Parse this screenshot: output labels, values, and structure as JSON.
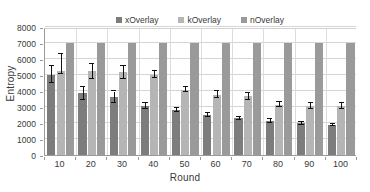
{
  "chart_data": {
    "type": "bar",
    "title": "",
    "xlabel": "Round",
    "ylabel": "Entropy",
    "categories": [
      "10",
      "20",
      "30",
      "40",
      "50",
      "60",
      "70",
      "80",
      "90",
      "100"
    ],
    "ylim": [
      0,
      8000
    ],
    "ytick_step": 1000,
    "yticks": [
      "0",
      "1000",
      "2000",
      "3000",
      "4000",
      "5000",
      "6000",
      "7000",
      "8000"
    ],
    "grid": true,
    "grid_axis": "both",
    "legend_position": "top-center",
    "series": [
      {
        "name": "xOverlay",
        "color": "#7d7d7d",
        "values": [
          5030,
          3880,
          3600,
          3080,
          2800,
          2520,
          2300,
          2140,
          2000,
          1880
        ],
        "err_low": [
          4480,
          3450,
          3280,
          2880,
          2660,
          2400,
          2210,
          2030,
          1900,
          1790
        ],
        "err_high": [
          5580,
          4280,
          3970,
          3270,
          2950,
          2630,
          2400,
          2230,
          2080,
          1960
        ]
      },
      {
        "name": "kOverlay",
        "color": "#b5b5b5",
        "values": [
          5280,
          5230,
          5200,
          5030,
          4090,
          3780,
          3700,
          3140,
          3070,
          3080
        ],
        "err_low": [
          5060,
          4760,
          4760,
          4800,
          3960,
          3580,
          3450,
          2980,
          2900,
          2900
        ],
        "err_high": [
          6300,
          5700,
          5560,
          5270,
          4220,
          4010,
          3900,
          3330,
          3240,
          3250
        ]
      },
      {
        "name": "nOverlay",
        "color": "#9a9a9a",
        "values": [
          7000,
          7000,
          7000,
          7000,
          7000,
          7000,
          7000,
          7000,
          7000,
          7000
        ],
        "clipped_at": 7000,
        "note": "bars reach the top of the 7000 gridline"
      }
    ]
  },
  "legend": {
    "items": [
      {
        "label": "xOverlay"
      },
      {
        "label": "kOverlay"
      },
      {
        "label": "nOverlay"
      }
    ]
  }
}
